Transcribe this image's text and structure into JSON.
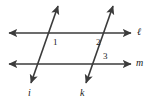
{
  "figure": {
    "width": 148,
    "height": 102,
    "background_color": "#ffffff",
    "stroke_color": "#3b3b3b",
    "label_color": "#1a1a1a",
    "stroke_width": 1.6,
    "lines": [
      {
        "name": "line-ell",
        "label": "ℓ",
        "label_x": 137,
        "label_y": 27,
        "x1": 9,
        "y1": 33,
        "x2": 131,
        "y2": 33,
        "arrows": "both"
      },
      {
        "name": "line-m",
        "label": "m",
        "label_x": 136,
        "label_y": 58,
        "x1": 9,
        "y1": 64,
        "x2": 131,
        "y2": 64,
        "arrows": "both"
      },
      {
        "name": "line-i",
        "label": "i",
        "label_x": 28,
        "label_y": 88,
        "x1": 58,
        "y1": 5,
        "x2": 31,
        "y2": 84,
        "arrows": "both"
      },
      {
        "name": "line-k",
        "label": "k",
        "label_x": 80,
        "label_y": 88,
        "x1": 113,
        "y1": 5,
        "x2": 86,
        "y2": 84,
        "arrows": "both"
      }
    ],
    "angle_labels": [
      {
        "name": "angle-1",
        "text": "1",
        "x": 53,
        "y": 38
      },
      {
        "name": "angle-2",
        "text": "2",
        "x": 96,
        "y": 38
      },
      {
        "name": "angle-3",
        "text": "3",
        "x": 103,
        "y": 52
      }
    ]
  }
}
